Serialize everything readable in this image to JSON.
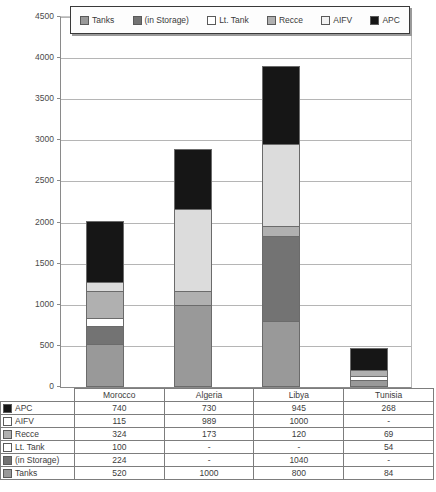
{
  "chart_data": {
    "type": "bar",
    "stacked": true,
    "title": "",
    "xlabel": "",
    "ylabel": "",
    "ylim": [
      0,
      4500
    ],
    "ytick_step": 500,
    "yticks": [
      4500,
      4000,
      3500,
      3000,
      2500,
      2000,
      1500,
      1000,
      500,
      0
    ],
    "grid": true,
    "legend_position": "top",
    "categories": [
      "Morocco",
      "Algeria",
      "Libya",
      "Tunisia"
    ],
    "series": [
      {
        "name": "Tanks",
        "values": [
          520,
          1000,
          800,
          84
        ],
        "color": "#999999",
        "swatch": "#999999"
      },
      {
        "name": "(in Storage)",
        "values": [
          224,
          null,
          1040,
          null
        ],
        "color": "#737373",
        "swatch": "#737373"
      },
      {
        "name": "Lt. Tank",
        "values": [
          100,
          null,
          null,
          54
        ],
        "color": "#ffffff",
        "swatch": "#ffffff"
      },
      {
        "name": "Recce",
        "values": [
          324,
          173,
          120,
          69
        ],
        "color": "#b0b0b0",
        "swatch": "#b0b0b0"
      },
      {
        "name": "AIFV",
        "values": [
          115,
          989,
          1000,
          null
        ],
        "color": "#dcdcdc",
        "swatch": "#f2f2f2"
      },
      {
        "name": "APC",
        "values": [
          740,
          730,
          945,
          268
        ],
        "color": "#161616",
        "swatch": "#161616"
      }
    ],
    "stack_order_bottom_to_top": [
      "Tanks",
      "(in Storage)",
      "Lt. Tank",
      "Recce",
      "AIFV",
      "APC"
    ],
    "totals": [
      2023,
      2892,
      3905,
      475
    ]
  },
  "legend": {
    "items": [
      {
        "label": "Tanks",
        "swatch": "#999999"
      },
      {
        "label": "(in Storage)",
        "swatch": "#737373"
      },
      {
        "label": "Lt. Tank",
        "swatch": "#ffffff"
      },
      {
        "label": "Recce",
        "swatch": "#b0b0b0"
      },
      {
        "label": "AIFV",
        "swatch": "#f2f2f2"
      },
      {
        "label": "APC",
        "swatch": "#161616"
      }
    ]
  },
  "axis": {
    "y_labels": [
      "4500",
      "4000",
      "3500",
      "3000",
      "2500",
      "2000",
      "1500",
      "1000",
      "500",
      "0"
    ]
  },
  "table": {
    "column_headers": [
      "",
      "Morocco",
      "Algeria",
      "Libya",
      "Tunisia"
    ],
    "rows": [
      {
        "label": "APC",
        "swatch": "#161616",
        "values": [
          "740",
          "730",
          "945",
          "268"
        ]
      },
      {
        "label": "AIFV",
        "swatch": "#ffffff",
        "values": [
          "115",
          "989",
          "1000",
          "-"
        ]
      },
      {
        "label": "Recce",
        "swatch": "#b0b0b0",
        "values": [
          "324",
          "173",
          "120",
          "69"
        ]
      },
      {
        "label": "Lt. Tank",
        "swatch": "#ffffff",
        "values": [
          "100",
          "-",
          "-",
          "54"
        ]
      },
      {
        "label": "(in Storage)",
        "swatch": "#737373",
        "values": [
          "224",
          "-",
          "1040",
          "-"
        ]
      },
      {
        "label": "Tanks",
        "swatch": "#999999",
        "values": [
          "520",
          "1000",
          "800",
          "84"
        ]
      }
    ]
  }
}
